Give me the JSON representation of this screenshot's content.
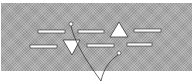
{
  "figure": {
    "background": "#ffffff",
    "panel": {
      "x": 1,
      "y": 3,
      "width": 191,
      "height": 68,
      "color": "#a9a9a9",
      "texture": "halftone"
    },
    "dashes": [
      {
        "id": "dash-1",
        "x": 38,
        "y": 30,
        "width": 27,
        "height": 3
      },
      {
        "id": "dash-2",
        "x": 78,
        "y": 30,
        "width": 26,
        "height": 3
      },
      {
        "id": "dash-3",
        "x": 134,
        "y": 29,
        "width": 27,
        "height": 3
      },
      {
        "id": "dash-4",
        "x": 30,
        "y": 45,
        "width": 27,
        "height": 3
      },
      {
        "id": "dash-5",
        "x": 87,
        "y": 44,
        "width": 27,
        "height": 3
      },
      {
        "id": "dash-6",
        "x": 127,
        "y": 43,
        "width": 25,
        "height": 3
      }
    ],
    "triangles": [
      {
        "id": "triangle-up",
        "points": "119,22 110,37 128,37"
      },
      {
        "id": "triangle-down",
        "points": "63,40 80,40 72,55"
      }
    ],
    "markers": [
      {
        "id": "marker-circle-top",
        "cx": 71,
        "cy": 24,
        "r": 2
      },
      {
        "id": "marker-circle-right",
        "cx": 119,
        "cy": 53,
        "r": 2
      }
    ],
    "leader_lines": [
      {
        "id": "leader-line-left",
        "d": "M71,26 C74,40 84,58 101,81"
      },
      {
        "id": "leader-line-right",
        "d": "M118,55 C110,60 104,68 101,81"
      }
    ],
    "stroke_color": "#222222",
    "shape_fill": "#ffffff"
  }
}
